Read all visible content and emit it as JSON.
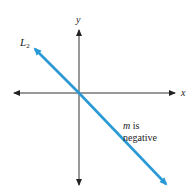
{
  "diagram": {
    "type": "coordinate-plane-line",
    "axes": {
      "x_label": "x",
      "y_label": "y",
      "color": "#333333"
    },
    "line": {
      "name_main": "L",
      "name_subscript": "2",
      "color": "#2a9ad6",
      "slope_sign": "negative"
    },
    "annotation": {
      "line1_var": "m",
      "line1_rest": " is",
      "line2": "negative"
    }
  }
}
